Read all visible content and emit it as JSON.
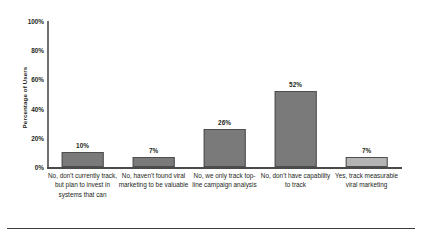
{
  "chart_data": {
    "type": "bar",
    "title": "",
    "subtitle": "",
    "xlabel": "",
    "ylabel": "Percentage of Users",
    "ylim": [
      0,
      100
    ],
    "grid": false,
    "legend": "none",
    "axis": {
      "y_ticks": [
        "0%",
        "20%",
        "40%",
        "60%",
        "80%",
        "100%"
      ],
      "y_tick_values": [
        0,
        20,
        40,
        60,
        80,
        100
      ]
    },
    "categories": [
      "No, don't currently track, but plan to invest in systems that can",
      "No, haven't found viral marketing to be valuable",
      "No, we only track top-line campaign analysis",
      "No, don't have capability to track",
      "Yes, track measurable viral marketing"
    ],
    "values": [
      10,
      7,
      26,
      52,
      7
    ],
    "value_labels": [
      "10%",
      "7%",
      "26%",
      "52%",
      "7%"
    ],
    "bar_colors": [
      "#7a7a7a",
      "#7a7a7a",
      "#7a7a7a",
      "#7a7a7a",
      "#b4b4b4"
    ],
    "bar_edge_color": "#4e4e4e"
  },
  "colors": {
    "background": "#ffffff",
    "text": "#231f20",
    "axis": "#4a4a4a",
    "bar_dark": "#7a7a7a",
    "bar_light": "#b4b4b4"
  }
}
